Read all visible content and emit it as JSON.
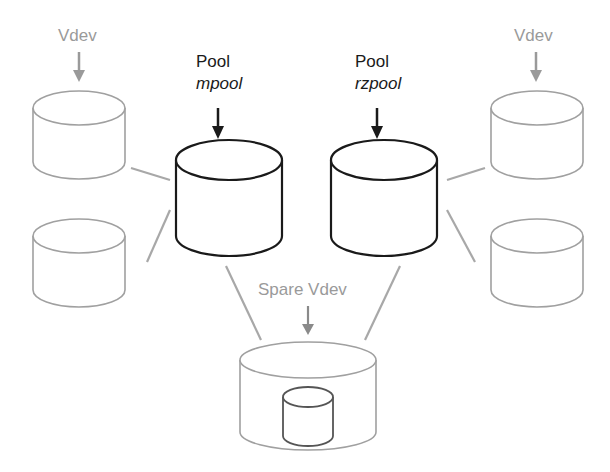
{
  "diagram": {
    "pools": [
      {
        "label": "Pool",
        "name": "mpool"
      },
      {
        "label": "Pool",
        "name": "rzpool"
      }
    ],
    "vdev_labels": {
      "left": "Vdev",
      "right": "Vdev"
    },
    "spare_label": "Spare Vdev",
    "colors": {
      "pool": "#1a1a1a",
      "vdev": "#9a9a9a",
      "background": "#ffffff"
    }
  }
}
